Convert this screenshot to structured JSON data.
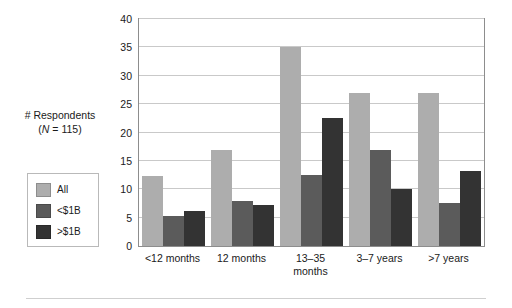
{
  "chart_data": {
    "type": "bar",
    "title": "",
    "subtitle": "",
    "xlabel": "",
    "ylabel": "# Respondents (N = 115)",
    "ylabel_line1": "# Respondents",
    "ylabel_line2_prefix": "(",
    "ylabel_line2_italic": "N",
    "ylabel_line2_suffix": " = 115)",
    "categories": [
      "<12 months",
      "12 months",
      "13–35 months",
      "3–7 years",
      ">7 years"
    ],
    "category_lines": [
      [
        "<12 months"
      ],
      [
        "12 months"
      ],
      [
        "13–35",
        "months"
      ],
      [
        "3–7 years"
      ],
      [
        ">7 years"
      ]
    ],
    "series": [
      {
        "name": "All",
        "color": "#adadad",
        "values": [
          12.3,
          17,
          35,
          27,
          27
        ]
      },
      {
        "name": "<$1B",
        "color": "#5b5b5b",
        "values": [
          5.3,
          8,
          12.6,
          17,
          7.5
        ]
      },
      {
        "name": ">$1B",
        "color": "#333333",
        "values": [
          6.2,
          7.3,
          22.5,
          10,
          13.2
        ]
      }
    ],
    "ylim": [
      0,
      40
    ],
    "ytick_step": 5,
    "yticks": [
      0,
      5,
      10,
      15,
      20,
      25,
      30,
      35,
      40
    ],
    "ytick_labels": [
      "0",
      "5",
      "10",
      "15",
      "20",
      "25",
      "30",
      "35",
      "40"
    ],
    "grid": "horizontal",
    "grid_color": "#c9c9c9",
    "legend_position": "left-outside",
    "legend_entries": [
      {
        "label": "All",
        "color": "#adadad"
      },
      {
        "label": "<$1B",
        "color": "#5b5b5b"
      },
      {
        "label": ">$1B",
        "color": "#333333"
      }
    ],
    "frame_color": "#8d8d8d",
    "background": "#ffffff"
  }
}
